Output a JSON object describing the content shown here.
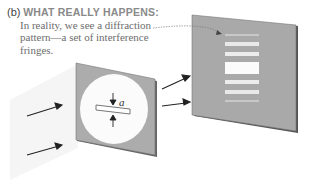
{
  "caption": {
    "tag": "(b)",
    "heading": "WHAT REALLY HAPPENS:",
    "lines": [
      "In reality, we see a diffraction",
      "pattern—a set of interference",
      "fringes."
    ]
  },
  "diagram": {
    "slit_label": "a",
    "colors": {
      "screen": "#a9a9a9",
      "screen_edge": "#555555",
      "fringe": "#e9e9e9",
      "central_fringe": "#fbfbfb",
      "beam": "#efefef",
      "arrow": "#222222",
      "text": "#6d6d6d"
    }
  }
}
